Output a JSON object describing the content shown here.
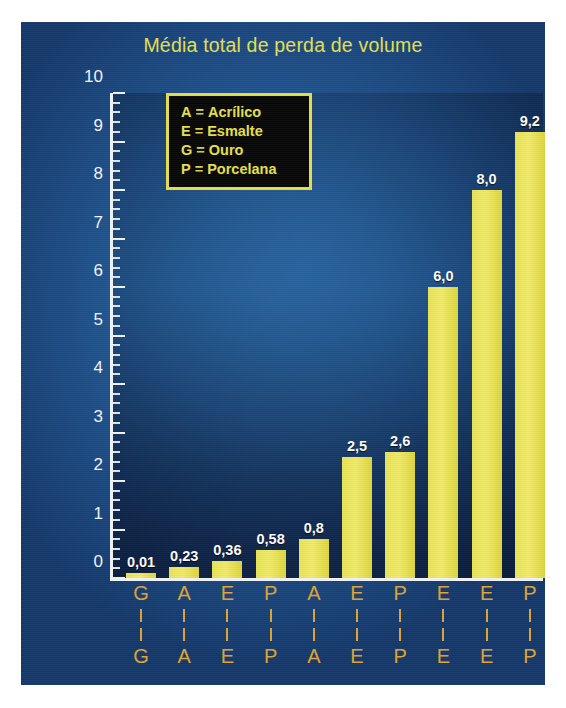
{
  "figure": {
    "title": "Média total de perda de volume",
    "panel_color": "#255f9c",
    "title_color": "#e8e14a",
    "bar_color": "#eee65f",
    "tick_color": "#f2f4f6",
    "category_label_color": "#e2a42c"
  },
  "yaxis": {
    "label": "Perda de volume (cc = 10 – 5)",
    "ticks": [
      "0",
      "1",
      "2",
      "3",
      "4",
      "5",
      "6",
      "7",
      "8",
      "9",
      "10"
    ],
    "min": 0,
    "max": 10,
    "minor_step": 0.2
  },
  "legend": {
    "entries": [
      {
        "key": "A",
        "eq": "=",
        "name": "Acrílico"
      },
      {
        "key": "E",
        "eq": "=",
        "name": "Esmalte"
      },
      {
        "key": "G",
        "eq": "=",
        "name": "Ouro"
      },
      {
        "key": "P",
        "eq": "=",
        "name": "Porcelana"
      }
    ]
  },
  "bars": [
    {
      "top_letter": "G",
      "bottom_letter": "G",
      "value_label": "0,01",
      "value": 0.01
    },
    {
      "top_letter": "A",
      "bottom_letter": "A",
      "value_label": "0,23",
      "value": 0.23
    },
    {
      "top_letter": "E",
      "bottom_letter": "E",
      "value_label": "0,36",
      "value": 0.36
    },
    {
      "top_letter": "P",
      "bottom_letter": "P",
      "value_label": "0,58",
      "value": 0.58
    },
    {
      "top_letter": "A",
      "bottom_letter": "A",
      "value_label": "0,8",
      "value": 0.8
    },
    {
      "top_letter": "E",
      "bottom_letter": "E",
      "value_label": "2,5",
      "value": 2.5
    },
    {
      "top_letter": "P",
      "bottom_letter": "P",
      "value_label": "2,6",
      "value": 2.6
    },
    {
      "top_letter": "E",
      "bottom_letter": "E",
      "value_label": "6,0",
      "value": 6.0
    },
    {
      "top_letter": "E",
      "bottom_letter": "E",
      "value_label": "8,0",
      "value": 8.0
    },
    {
      "top_letter": "P",
      "bottom_letter": "P",
      "value_label": "9,2",
      "value": 9.2
    }
  ],
  "chart_data": {
    "type": "bar",
    "title": "Média total de perda de volume",
    "xlabel": "",
    "ylabel": "Perda de volume (cc = 10 – 5)",
    "ylim": [
      0,
      10
    ],
    "ytick_values": [
      0,
      1,
      2,
      3,
      4,
      5,
      6,
      7,
      8,
      9,
      10
    ],
    "grid": false,
    "legend_position": "inside-top-left",
    "legend_entries": [
      "A = Acrílico",
      "E = Esmalte",
      "G = Ouro",
      "P = Porcelana"
    ],
    "categories": [
      "G",
      "A",
      "E",
      "P",
      "A",
      "E",
      "P",
      "E",
      "E",
      "P"
    ],
    "values": [
      0.01,
      0.23,
      0.36,
      0.58,
      0.8,
      2.5,
      2.6,
      6.0,
      8.0,
      9.2
    ],
    "data_labels": [
      "0,01",
      "0,23",
      "0,36",
      "0,58",
      "0,8",
      "2,5",
      "2,6",
      "6,0",
      "8,0",
      "9,2"
    ],
    "bar_color": "#eee65f",
    "annotations": []
  }
}
